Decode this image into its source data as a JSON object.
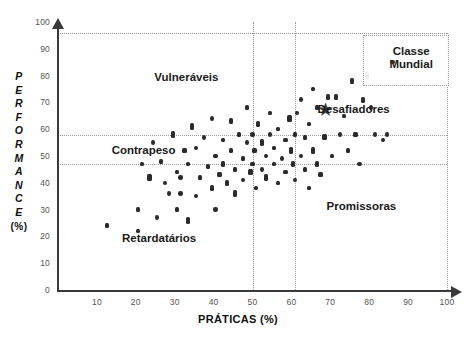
{
  "chart_data": {
    "type": "scatter",
    "title": "",
    "xlabel": "PRÁTICAS (%)",
    "ylabel_letters": [
      "P",
      "E",
      "R",
      "F",
      "O",
      "R",
      "M",
      "A",
      "N",
      "C",
      "E"
    ],
    "ylabel_suffix": "(%)",
    "ylabel": "PERFORMANCE (%)",
    "xlim": [
      0,
      100
    ],
    "ylim": [
      0,
      100
    ],
    "xticks": [
      10,
      20,
      30,
      40,
      50,
      60,
      70,
      80,
      90,
      100
    ],
    "yticks": [
      0,
      10,
      20,
      30,
      40,
      50,
      60,
      70,
      80,
      90,
      100
    ],
    "grid": "dotted",
    "gridlines_vertical": [
      50,
      61
    ],
    "gridlines_horizontal": [
      47,
      58
    ],
    "frame_top_y": 96,
    "frame_right_x": 100,
    "legend": "none",
    "marker_color": "#2b2b2b",
    "annotations": [
      {
        "text": "Vulneráveis",
        "x": 33,
        "y": 79
      },
      {
        "text": "Contrapeso",
        "x": 22,
        "y": 52
      },
      {
        "text": "Retardatários",
        "x": 26,
        "y": 19
      },
      {
        "text": "Promissoras",
        "x": 78,
        "y": 31
      },
      {
        "text": "Desafiadores",
        "x": 76,
        "y": 67
      },
      {
        "text": "Classe Mundial",
        "x": 89,
        "y": 88
      }
    ],
    "star_marker": {
      "x": 69,
      "y": 67,
      "label": "Desafiadores"
    },
    "classe_mundial_dot": {
      "x": 86,
      "y": 85
    },
    "points": [
      {
        "x": 12.5,
        "y": 24
      },
      {
        "x": 20.5,
        "y": 22
      },
      {
        "x": 20.5,
        "y": 30
      },
      {
        "x": 21.5,
        "y": 47
      },
      {
        "x": 23.5,
        "y": 42
      },
      {
        "x": 24.5,
        "y": 55
      },
      {
        "x": 25.5,
        "y": 27
      },
      {
        "x": 26.5,
        "y": 48
      },
      {
        "x": 27.5,
        "y": 40
      },
      {
        "x": 28.5,
        "y": 36
      },
      {
        "x": 29.5,
        "y": 58
      },
      {
        "x": 30.5,
        "y": 30
      },
      {
        "x": 30.5,
        "y": 44
      },
      {
        "x": 31.5,
        "y": 36
      },
      {
        "x": 31.5,
        "y": 42
      },
      {
        "x": 32.5,
        "y": 52
      },
      {
        "x": 33.5,
        "y": 26
      },
      {
        "x": 33.5,
        "y": 47
      },
      {
        "x": 34.5,
        "y": 61
      },
      {
        "x": 35.5,
        "y": 35
      },
      {
        "x": 35.5,
        "y": 53
      },
      {
        "x": 36.5,
        "y": 42
      },
      {
        "x": 37.5,
        "y": 57
      },
      {
        "x": 38.5,
        "y": 46
      },
      {
        "x": 39.5,
        "y": 38
      },
      {
        "x": 39.5,
        "y": 64
      },
      {
        "x": 40.5,
        "y": 30
      },
      {
        "x": 40.5,
        "y": 50
      },
      {
        "x": 41.5,
        "y": 43
      },
      {
        "x": 42.5,
        "y": 56
      },
      {
        "x": 42.5,
        "y": 47
      },
      {
        "x": 43.5,
        "y": 40
      },
      {
        "x": 44.5,
        "y": 52
      },
      {
        "x": 44.5,
        "y": 63
      },
      {
        "x": 45.5,
        "y": 45
      },
      {
        "x": 45.5,
        "y": 36
      },
      {
        "x": 46.5,
        "y": 58
      },
      {
        "x": 47.5,
        "y": 49
      },
      {
        "x": 47.5,
        "y": 41
      },
      {
        "x": 48.5,
        "y": 55
      },
      {
        "x": 48.5,
        "y": 68
      },
      {
        "x": 49.5,
        "y": 44
      },
      {
        "x": 50.0,
        "y": 58
      },
      {
        "x": 50.0,
        "y": 47
      },
      {
        "x": 50.5,
        "y": 52
      },
      {
        "x": 51.0,
        "y": 38
      },
      {
        "x": 51.5,
        "y": 62
      },
      {
        "x": 52.5,
        "y": 45
      },
      {
        "x": 52.5,
        "y": 55
      },
      {
        "x": 53.5,
        "y": 50
      },
      {
        "x": 53.5,
        "y": 42
      },
      {
        "x": 54.5,
        "y": 58
      },
      {
        "x": 54.5,
        "y": 66
      },
      {
        "x": 55.5,
        "y": 47
      },
      {
        "x": 55.5,
        "y": 53
      },
      {
        "x": 56.5,
        "y": 40
      },
      {
        "x": 56.5,
        "y": 60
      },
      {
        "x": 57.5,
        "y": 49
      },
      {
        "x": 58.5,
        "y": 56
      },
      {
        "x": 58.5,
        "y": 44
      },
      {
        "x": 59.5,
        "y": 64
      },
      {
        "x": 60.0,
        "y": 52
      },
      {
        "x": 60.5,
        "y": 47
      },
      {
        "x": 61.0,
        "y": 58
      },
      {
        "x": 61.0,
        "y": 41
      },
      {
        "x": 61.5,
        "y": 66
      },
      {
        "x": 62.5,
        "y": 50
      },
      {
        "x": 62.5,
        "y": 71
      },
      {
        "x": 63.5,
        "y": 45
      },
      {
        "x": 63.5,
        "y": 57
      },
      {
        "x": 64.5,
        "y": 62
      },
      {
        "x": 64.5,
        "y": 38
      },
      {
        "x": 65.5,
        "y": 75
      },
      {
        "x": 65.5,
        "y": 52
      },
      {
        "x": 66.5,
        "y": 47
      },
      {
        "x": 66.5,
        "y": 68
      },
      {
        "x": 67.5,
        "y": 43
      },
      {
        "x": 68.5,
        "y": 57
      },
      {
        "x": 69.5,
        "y": 72
      },
      {
        "x": 70.5,
        "y": 50
      },
      {
        "x": 71.5,
        "y": 72
      },
      {
        "x": 72.5,
        "y": 58
      },
      {
        "x": 73.5,
        "y": 65
      },
      {
        "x": 74.5,
        "y": 52
      },
      {
        "x": 75.5,
        "y": 78
      },
      {
        "x": 76.5,
        "y": 58
      },
      {
        "x": 77.5,
        "y": 47
      },
      {
        "x": 78.5,
        "y": 71
      },
      {
        "x": 79.5,
        "y": 80
      },
      {
        "x": 80.5,
        "y": 68
      },
      {
        "x": 81.5,
        "y": 58
      },
      {
        "x": 83.5,
        "y": 56
      },
      {
        "x": 84.5,
        "y": 58
      }
    ]
  }
}
